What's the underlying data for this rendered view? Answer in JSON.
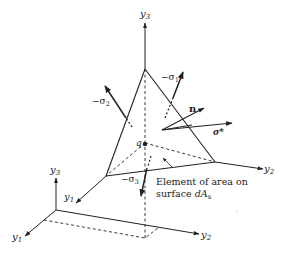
{
  "figure": {
    "type": "stress tetrahedron diagram",
    "labels": {
      "y3_top": "y",
      "y3_top_sub": "3",
      "y2_right": "y",
      "y2_right_sub": "2",
      "y1_mid": "y",
      "y1_mid_sub": "1",
      "y3_small": "y",
      "y3_small_sub": "3",
      "y1_small": "y",
      "y1_small_sub": "1",
      "y2_small": "y",
      "y2_small_sub": "2",
      "sigma1": "−σ",
      "sigma1_sub": "1",
      "sigma2": "−σ",
      "sigma2_sub": "2",
      "sigma3": "−σ",
      "sigma3_sub": "3",
      "normal": "n",
      "sigma_star": "σ*",
      "point_q": "q"
    },
    "annotation": {
      "line1": "Element of area on",
      "line2_prefix": "surface ",
      "line2_var": "dA",
      "line2_sub": "s"
    }
  }
}
